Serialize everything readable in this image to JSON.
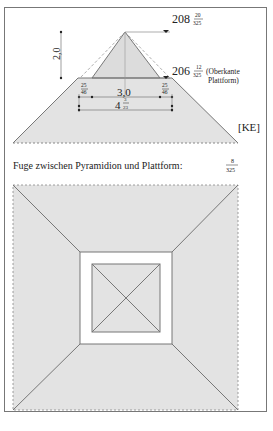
{
  "diagram": {
    "title_cut_top": "",
    "elevation": {
      "apex_level": {
        "whole": "208",
        "num": "20",
        "den": "325"
      },
      "platform_level": {
        "whole": "206",
        "num": "12",
        "den": "325"
      },
      "platform_note_line1": "(Oberkante",
      "platform_note_line2": "Plattform)",
      "height_dim": "2,0",
      "base_dim": "3,0",
      "left_offset": {
        "num": "25",
        "den": "46"
      },
      "right_offset": {
        "num": "25",
        "den": "46"
      },
      "platform_width": {
        "whole": "4",
        "num": "3",
        "den": "23"
      },
      "label": "[KE]"
    },
    "joint_note": {
      "text": "Fuge zwischen Pyramidion und Plattform:",
      "num": "8",
      "den": "325"
    },
    "plan": {
      "description": "Top view: platform square with inner pyramidion square and diagonals"
    },
    "colors": {
      "fill": "#e3e3e3",
      "stroke": "#777777",
      "text": "#222222",
      "frame": "#777777"
    }
  }
}
